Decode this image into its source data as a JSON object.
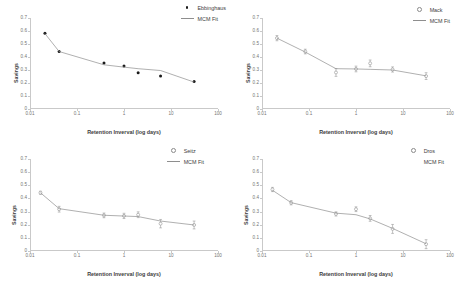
{
  "figure": {
    "background": "#ffffff",
    "marker_color_filled": "#1a1a1a",
    "marker_color_open": "#8a8a8a",
    "fit_line_color": "#8e8e8e",
    "axis_color": "#c9c9c9"
  },
  "axes": {
    "ylabel": "Savings",
    "xlabel": "Retention Inverval (log days)",
    "yticks": [
      "0.7",
      "0.6",
      "0.5",
      "0.4",
      "0.3",
      "0.2",
      "0.1",
      "0"
    ],
    "ytick_values": [
      0.7,
      0.6,
      0.5,
      0.4,
      0.3,
      0.2,
      0.1,
      0
    ],
    "xticks": [
      "0.01",
      "0.1",
      "1",
      "10",
      "100"
    ],
    "xtick_values": [
      0.01,
      0.1,
      1,
      10,
      100
    ],
    "ylim": [
      0,
      0.7
    ],
    "xlim": [
      0.01,
      100
    ]
  },
  "legend_fit_label": "MCM Fit",
  "chart_data": [
    {
      "type": "scatter",
      "panel": "top-left",
      "title": "",
      "xlabel": "Retention Inverval (log days)",
      "ylabel": "Savings",
      "xlim": [
        0.01,
        100
      ],
      "ylim": [
        0,
        0.7
      ],
      "xscale": "log",
      "grid": false,
      "legend_position": "top-right",
      "series": [
        {
          "name": "Ebbinghaus",
          "marker": "filled-circle",
          "errorbars": false,
          "x": [
            0.0208,
            0.0417,
            0.375,
            1.0,
            2.0,
            6.0,
            31.0
          ],
          "y": [
            0.582,
            0.442,
            0.353,
            0.331,
            0.279,
            0.254,
            0.211
          ]
        },
        {
          "name": "MCM Fit",
          "marker": "line",
          "x": [
            0.0208,
            0.0417,
            0.375,
            1.0,
            2.0,
            6.0,
            31.0
          ],
          "y": [
            0.58,
            0.442,
            0.34,
            0.322,
            0.31,
            0.296,
            0.207
          ]
        }
      ]
    },
    {
      "type": "scatter",
      "panel": "top-right",
      "title": "",
      "xlabel": "Retention Inverval (log days)",
      "ylabel": "Savings",
      "xlim": [
        0.01,
        100
      ],
      "ylim": [
        0,
        0.7
      ],
      "xscale": "log",
      "grid": false,
      "legend_position": "top-right",
      "series": [
        {
          "name": "Mack",
          "marker": "open-circle",
          "errorbars": true,
          "x": [
            0.0208,
            0.0833,
            0.375,
            1.0,
            2.0,
            6.0,
            31.0
          ],
          "y": [
            0.545,
            0.442,
            0.281,
            0.308,
            0.351,
            0.304,
            0.253
          ],
          "yerr": [
            0.02,
            0.018,
            0.03,
            0.022,
            0.026,
            0.02,
            0.026
          ]
        },
        {
          "name": "MCM Fit",
          "marker": "line",
          "x": [
            0.0208,
            0.0833,
            0.375,
            1.0,
            2.0,
            6.0,
            31.0
          ],
          "y": [
            0.545,
            0.438,
            0.31,
            0.308,
            0.305,
            0.3,
            0.255
          ]
        }
      ]
    },
    {
      "type": "scatter",
      "panel": "bottom-left",
      "title": "",
      "xlabel": "Retention Inverval (log days)",
      "ylabel": "Savings",
      "xlim": [
        0.01,
        100
      ],
      "ylim": [
        0,
        0.7
      ],
      "xscale": "log",
      "grid": false,
      "legend_position": "top-right",
      "series": [
        {
          "name": "Seitz",
          "marker": "open-circle",
          "errorbars": true,
          "x": [
            0.0167,
            0.0417,
            0.375,
            1.0,
            2.0,
            6.0,
            31.0
          ],
          "y": [
            0.443,
            0.318,
            0.271,
            0.267,
            0.276,
            0.208,
            0.198
          ],
          "yerr": [
            0.012,
            0.022,
            0.018,
            0.02,
            0.022,
            0.032,
            0.03
          ]
        },
        {
          "name": "MCM Fit",
          "marker": "line",
          "x": [
            0.0167,
            0.0417,
            0.375,
            1.0,
            2.0,
            6.0,
            31.0
          ],
          "y": [
            0.443,
            0.322,
            0.272,
            0.266,
            0.262,
            0.228,
            0.198
          ]
        }
      ]
    },
    {
      "type": "scatter",
      "panel": "bottom-right",
      "title": "",
      "xlabel": "Retention Inverval (log days)",
      "ylabel": "Savings",
      "xlim": [
        0.01,
        100
      ],
      "ylim": [
        0,
        0.7
      ],
      "xscale": "log",
      "grid": false,
      "legend_position": "top-right",
      "series": [
        {
          "name": "Dros",
          "marker": "open-circle",
          "errorbars": true,
          "x": [
            0.0167,
            0.0417,
            0.375,
            1.0,
            2.0,
            6.0,
            31.0
          ],
          "y": [
            0.468,
            0.367,
            0.282,
            0.318,
            0.248,
            0.168,
            0.052
          ],
          "yerr": [
            0.016,
            0.016,
            0.016,
            0.018,
            0.022,
            0.034,
            0.034
          ]
        },
        {
          "name": "MCM Fit",
          "marker": "line",
          "x": [
            0.0167,
            0.0417,
            0.375,
            1.0,
            2.0,
            6.0,
            31.0
          ],
          "y": [
            0.462,
            0.368,
            0.288,
            0.276,
            0.244,
            0.172,
            0.055
          ]
        }
      ]
    }
  ]
}
